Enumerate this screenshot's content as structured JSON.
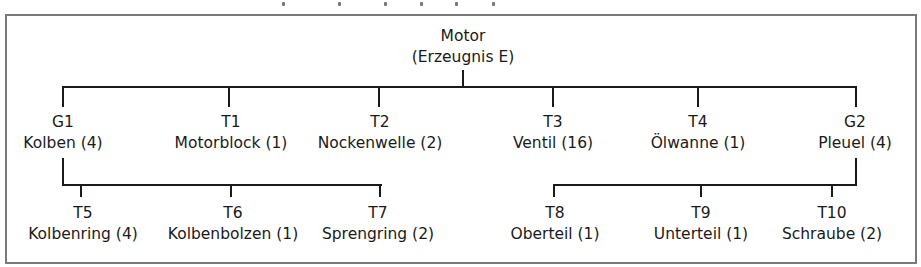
{
  "diagram": {
    "type": "bill-of-materials-tree",
    "root": {
      "line1": "Motor",
      "line2": "(Erzeugnis E)"
    },
    "level1": [
      {
        "id": "G1",
        "name": "Kolben (4)"
      },
      {
        "id": "T1",
        "name": "Motorblock (1)"
      },
      {
        "id": "T2",
        "name": "Nockenwelle (2)"
      },
      {
        "id": "T3",
        "name": "Ventil (16)"
      },
      {
        "id": "T4",
        "name": "Ölwanne (1)"
      },
      {
        "id": "G2",
        "name": "Pleuel (4)"
      }
    ],
    "g1_children": [
      {
        "id": "T5",
        "name": "Kolbenring (4)"
      },
      {
        "id": "T6",
        "name": "Kolbenbolzen (1)"
      },
      {
        "id": "T7",
        "name": "Sprengring (2)"
      }
    ],
    "g2_children": [
      {
        "id": "T8",
        "name": "Oberteil (1)"
      },
      {
        "id": "T9",
        "name": "Unterteil (1)"
      },
      {
        "id": "T10",
        "name": "Schraube (2)"
      }
    ],
    "colors": {
      "line": "#1a1a1a",
      "frame": "#7a7a7a",
      "background": "#ffffff"
    }
  }
}
